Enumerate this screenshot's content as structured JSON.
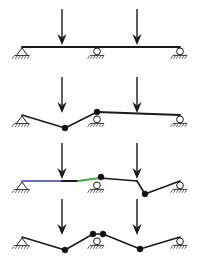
{
  "figure": {
    "canvas": {
      "width": 199,
      "height": 265,
      "background": "#ffffff"
    },
    "colors": {
      "ink": "#1a1a1a",
      "hatch": "#3a3a3a",
      "hinge": "#111111",
      "segment_purple": "#6a6ac8",
      "segment_green": "#44aa44",
      "support_fill": "#ffffff"
    },
    "geometry": {
      "beam_left_x": 22,
      "beam_right_x": 180,
      "support_mid_x": 97,
      "load_1_x": 62,
      "load_2_x": 137,
      "arrow_top_offset": -38,
      "beam_thickness": 2.2
    },
    "supports": [
      {
        "id": "support-left",
        "type": "pin",
        "x": 22,
        "label": "pinned support"
      },
      {
        "id": "support-mid",
        "type": "roller",
        "x": 97,
        "label": "roller support"
      },
      {
        "id": "support-right",
        "type": "roller",
        "x": 180,
        "label": "roller support"
      }
    ],
    "loads": [
      {
        "id": "load-1",
        "type": "point-load-down",
        "x": 62
      },
      {
        "id": "load-2",
        "type": "point-load-down",
        "x": 137
      }
    ],
    "panels": [
      {
        "id": "panel-1",
        "name": "undeformed-beam",
        "baseline_y": 47,
        "caption": "",
        "segments": [
          {
            "from_x": 22,
            "from_dy": 0,
            "to_x": 180,
            "to_dy": 0,
            "color": "#1a1a1a",
            "width": 2.2
          }
        ],
        "hinges": [],
        "loads_visible": [
          1,
          2
        ],
        "supports_visible": [
          "support-left",
          "support-mid",
          "support-right"
        ]
      },
      {
        "id": "panel-2",
        "name": "left-span-mechanism",
        "baseline_y": 115,
        "caption": "",
        "segments": [
          {
            "from_x": 22,
            "from_dy": 0,
            "to_x": 65,
            "to_dy": 13,
            "color": "#1a1a1a",
            "width": 1.6
          },
          {
            "from_x": 65,
            "from_dy": 13,
            "to_x": 97,
            "to_dy": -3,
            "color": "#1a1a1a",
            "width": 1.6
          },
          {
            "from_x": 97,
            "from_dy": -3,
            "to_x": 180,
            "to_dy": 0,
            "color": "#1a1a1a",
            "width": 2.2
          }
        ],
        "hinges": [
          {
            "x": 65,
            "dy": 13,
            "r": 3.0
          },
          {
            "x": 97,
            "dy": -3,
            "r": 3.0
          }
        ],
        "loads_visible": [
          1,
          2
        ],
        "supports_visible": [
          "support-left",
          "support-mid",
          "support-right"
        ]
      },
      {
        "id": "panel-3",
        "name": "right-span-mechanism",
        "baseline_y": 181,
        "caption": "",
        "segments": [
          {
            "from_x": 22,
            "from_dy": 0,
            "to_x": 62,
            "to_dy": 0,
            "color": "#6a6ac8",
            "width": 2.2
          },
          {
            "from_x": 62,
            "from_dy": 0,
            "to_x": 78,
            "to_dy": 0,
            "color": "#1a1a1a",
            "width": 2.2
          },
          {
            "from_x": 78,
            "from_dy": 0,
            "to_x": 100,
            "to_dy": -3,
            "color": "#44aa44",
            "width": 2.2
          },
          {
            "from_x": 100,
            "from_dy": -3,
            "to_x": 137,
            "to_dy": 0,
            "color": "#1a1a1a",
            "width": 1.6
          },
          {
            "from_x": 137,
            "from_dy": 0,
            "to_x": 145,
            "to_dy": 13,
            "color": "#1a1a1a",
            "width": 1.6
          },
          {
            "from_x": 145,
            "from_dy": 13,
            "to_x": 180,
            "to_dy": 0,
            "color": "#1a1a1a",
            "width": 1.6
          }
        ],
        "hinges": [
          {
            "x": 101,
            "dy": -4,
            "r": 3.0
          },
          {
            "x": 145,
            "dy": 13,
            "r": 3.0
          }
        ],
        "loads_visible": [
          1,
          2
        ],
        "supports_visible": [
          "support-left",
          "support-mid",
          "support-right"
        ]
      },
      {
        "id": "panel-4",
        "name": "combined-mechanism",
        "baseline_y": 237,
        "caption": "",
        "segments": [
          {
            "from_x": 22,
            "from_dy": 0,
            "to_x": 65,
            "to_dy": 13,
            "color": "#1a1a1a",
            "width": 1.6
          },
          {
            "from_x": 65,
            "from_dy": 13,
            "to_x": 93,
            "to_dy": -3,
            "color": "#1a1a1a",
            "width": 1.6
          },
          {
            "from_x": 93,
            "from_dy": -3,
            "to_x": 103,
            "to_dy": -3,
            "color": "#1a1a1a",
            "width": 1.6
          },
          {
            "from_x": 103,
            "from_dy": -3,
            "to_x": 140,
            "to_dy": 12,
            "color": "#1a1a1a",
            "width": 1.6
          },
          {
            "from_x": 140,
            "from_dy": 12,
            "to_x": 180,
            "to_dy": 0,
            "color": "#1a1a1a",
            "width": 1.6
          }
        ],
        "hinges": [
          {
            "x": 65,
            "dy": 13,
            "r": 3.0
          },
          {
            "x": 93,
            "dy": -3,
            "r": 3.0
          },
          {
            "x": 103,
            "dy": -3,
            "r": 3.0
          },
          {
            "x": 140,
            "dy": 12,
            "r": 3.0
          }
        ],
        "loads_visible": [
          1,
          2
        ],
        "supports_visible": [
          "support-left",
          "support-mid",
          "support-right"
        ]
      }
    ]
  }
}
